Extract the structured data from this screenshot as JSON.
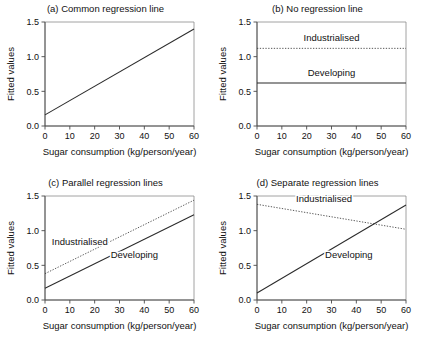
{
  "figure": {
    "background": "#ffffff",
    "line_color": "#2b2b2b",
    "axis_color": "#4a4a4a"
  },
  "axes_common": {
    "xlabel": "Sugar consumption (kg/person/year)",
    "ylabel": "Fitted values",
    "xticks": [
      "0",
      "10",
      "20",
      "30",
      "40",
      "50",
      "60"
    ],
    "yticks": [
      "0.0",
      "0.5",
      "1.0",
      "1.5"
    ],
    "xlim": [
      0,
      60
    ],
    "ylim": [
      0,
      1.5
    ]
  },
  "chart_data": [
    {
      "id": "panel-a",
      "type": "line",
      "title": "(a) Common regression line",
      "xlabel": "Sugar consumption (kg/person/year)",
      "ylabel": "Fitted values",
      "xlim": [
        0,
        60
      ],
      "ylim": [
        0,
        1.5
      ],
      "xticks": [
        0,
        10,
        20,
        30,
        40,
        50,
        60
      ],
      "yticks": [
        0.0,
        0.5,
        1.0,
        1.5
      ],
      "grid": false,
      "legend": "none",
      "series": [
        {
          "name": "Common",
          "style": "solid",
          "label": "",
          "x": [
            0,
            60
          ],
          "values": [
            0.16,
            1.4
          ],
          "intercept": 0.16,
          "slope": 0.0207
        }
      ]
    },
    {
      "id": "panel-b",
      "type": "line",
      "title": "(b) No regression line",
      "xlabel": "Sugar consumption (kg/person/year)",
      "ylabel": "Fitted values",
      "xlim": [
        0,
        60
      ],
      "ylim": [
        0,
        1.5
      ],
      "xticks": [
        0,
        10,
        20,
        30,
        40,
        50,
        60
      ],
      "yticks": [
        0.0,
        0.5,
        1.0,
        1.5
      ],
      "grid": false,
      "legend": "inline-labels",
      "series": [
        {
          "name": "Industrialised",
          "style": "dashed",
          "label": "Industrialised",
          "label_x": 30,
          "label_y": 1.22,
          "x": [
            0,
            60
          ],
          "values": [
            1.12,
            1.12
          ],
          "intercept": 1.12,
          "slope": 0.0
        },
        {
          "name": "Developing",
          "style": "solid",
          "label": "Developing",
          "label_x": 30,
          "label_y": 0.72,
          "x": [
            0,
            60
          ],
          "values": [
            0.62,
            0.62
          ],
          "intercept": 0.62,
          "slope": 0.0
        }
      ]
    },
    {
      "id": "panel-c",
      "type": "line",
      "title": "(c) Parallel regression lines",
      "xlabel": "Sugar consumption (kg/person/year)",
      "ylabel": "Fitted values",
      "xlim": [
        0,
        60
      ],
      "ylim": [
        0,
        1.5
      ],
      "xticks": [
        0,
        10,
        20,
        30,
        40,
        50,
        60
      ],
      "yticks": [
        0.0,
        0.5,
        1.0,
        1.5
      ],
      "grid": false,
      "legend": "inline-labels",
      "series": [
        {
          "name": "Industrialised",
          "style": "dashed",
          "label": "Industrialised",
          "label_x": 14,
          "label_y": 0.8,
          "x": [
            0,
            60
          ],
          "values": [
            0.38,
            1.44
          ],
          "intercept": 0.38,
          "slope": 0.0177
        },
        {
          "name": "Developing",
          "style": "solid",
          "label": "Developing",
          "label_x": 36,
          "label_y": 0.6,
          "x": [
            0,
            60
          ],
          "values": [
            0.17,
            1.23
          ],
          "intercept": 0.17,
          "slope": 0.0177
        }
      ]
    },
    {
      "id": "panel-d",
      "type": "line",
      "title": "(d) Separate regression lines",
      "xlabel": "Sugar consumption (kg/person/year)",
      "ylabel": "Fitted values",
      "xlim": [
        0,
        60
      ],
      "ylim": [
        0,
        1.5
      ],
      "xticks": [
        0,
        10,
        20,
        30,
        40,
        50,
        60
      ],
      "yticks": [
        0.0,
        0.5,
        1.0,
        1.5
      ],
      "grid": false,
      "legend": "inline-labels",
      "series": [
        {
          "name": "Industrialised",
          "style": "dashed",
          "label": "Industrialised",
          "label_x": 27,
          "label_y": 1.42,
          "x": [
            0,
            60
          ],
          "values": [
            1.38,
            1.02
          ],
          "intercept": 1.38,
          "slope": -0.006
        },
        {
          "name": "Developing",
          "style": "solid",
          "label": "Developing",
          "label_x": 37,
          "label_y": 0.6,
          "x": [
            0,
            60
          ],
          "values": [
            0.1,
            1.37
          ],
          "intercept": 0.1,
          "slope": 0.0212
        }
      ]
    }
  ]
}
